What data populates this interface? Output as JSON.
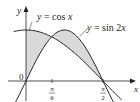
{
  "figure": {
    "axes": {
      "x_label": "x",
      "y_label": "y",
      "origin_label": "0",
      "ticks": [
        {
          "num": "π",
          "den": "6"
        },
        {
          "num": "π",
          "den": "2"
        }
      ]
    },
    "curves": [
      {
        "label": "y = cos x",
        "function": "cos(x)"
      },
      {
        "label": "y = sin 2x",
        "function": "sin(2x)"
      }
    ],
    "shaded_region": "area between y = cos x and y = sin 2x from x = 0 to x = π/2",
    "colors": {
      "curve": "#231f20",
      "fill": "#d9d9d9",
      "axis": "#231f20"
    }
  }
}
